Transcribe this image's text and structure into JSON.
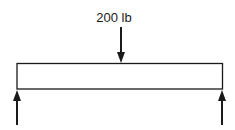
{
  "diagram": {
    "type": "simply-supported-beam",
    "load": {
      "label": "200 lb",
      "direction": "down",
      "position": "center"
    },
    "supports": [
      {
        "name": "left-reaction",
        "direction": "up",
        "position": "left-end"
      },
      {
        "name": "right-reaction",
        "direction": "up",
        "position": "right-end"
      }
    ],
    "colors": {
      "stroke": "#1a1a1a",
      "background": "#ffffff"
    }
  }
}
